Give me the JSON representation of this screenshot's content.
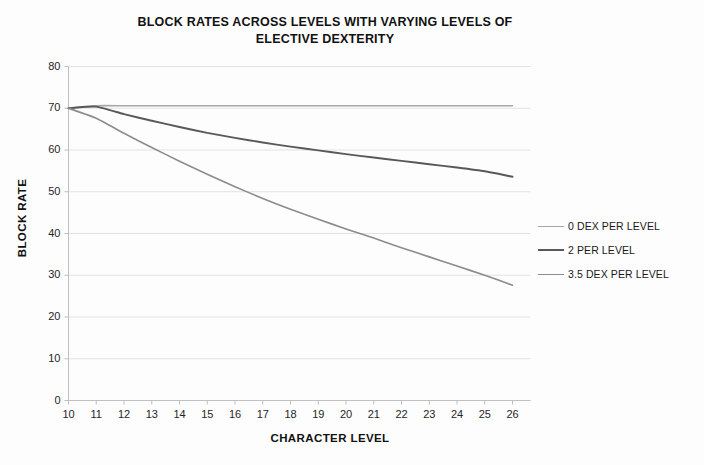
{
  "chart_data": {
    "type": "line",
    "title": "BLOCK RATES ACROSS LEVELS WITH VARYING LEVELS OF ELECTIVE DEXTERITY",
    "title_line1": "BLOCK RATES ACROSS LEVELS WITH VARYING LEVELS OF",
    "title_line2": "ELECTIVE DEXTERITY",
    "xlabel": "CHARACTER LEVEL",
    "ylabel": "BLOCK RATE",
    "x": [
      10,
      11,
      12,
      13,
      14,
      15,
      16,
      17,
      18,
      19,
      20,
      21,
      22,
      23,
      24,
      25,
      26
    ],
    "categories": [
      "10",
      "11",
      "12",
      "13",
      "14",
      "15",
      "16",
      "17",
      "18",
      "19",
      "20",
      "21",
      "22",
      "23",
      "24",
      "25",
      "26"
    ],
    "xlim": [
      10,
      26
    ],
    "ylim": [
      0,
      80
    ],
    "yticks": [
      0,
      10,
      20,
      30,
      40,
      50,
      60,
      70,
      80
    ],
    "ytick_labels": [
      "0",
      "10",
      "20",
      "30",
      "40",
      "50",
      "60",
      "70",
      "80"
    ],
    "grid": true,
    "grid_axis": "y",
    "legend_position": "right",
    "series": [
      {
        "name": "0 DEX PER LEVEL",
        "color": "#A6A6A6",
        "values": [
          70.0,
          70.6,
          70.6,
          70.6,
          70.6,
          70.6,
          70.6,
          70.6,
          70.6,
          70.6,
          70.6,
          70.6,
          70.6,
          70.6,
          70.6,
          70.6,
          70.6
        ]
      },
      {
        "name": "2 PER LEVEL",
        "color": "#595959",
        "values": [
          70.0,
          70.4,
          68.6,
          67.0,
          65.5,
          64.1,
          62.9,
          61.8,
          60.8,
          59.9,
          59.0,
          58.2,
          57.4,
          56.6,
          55.8,
          54.9,
          53.6
        ]
      },
      {
        "name": "3.5 DEX PER LEVEL",
        "color": "#8C8C8C",
        "values": [
          70.0,
          67.6,
          64.0,
          60.6,
          57.3,
          54.2,
          51.2,
          48.4,
          45.8,
          43.4,
          41.1,
          38.9,
          36.6,
          34.4,
          32.2,
          30.0,
          27.6
        ]
      }
    ]
  },
  "legend": {
    "items": [
      {
        "label": "0 DEX PER LEVEL"
      },
      {
        "label": "2 PER LEVEL"
      },
      {
        "label": "3.5 DEX PER LEVEL"
      }
    ]
  },
  "colors": {
    "series_0": "#A6A6A6",
    "series_1": "#595959",
    "series_2": "#8C8C8C",
    "grid": "#E2E2E2",
    "axis": "#BFBFBF",
    "text": "#1a1a1a",
    "background": "#fdfdfd"
  }
}
